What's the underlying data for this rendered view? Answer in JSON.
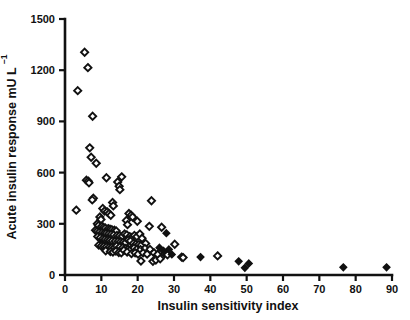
{
  "chart_data": {
    "type": "scatter",
    "title": "",
    "xlabel": "Insulin sensitivity index",
    "ylabel": "Acute insulin response mU L",
    "ylabel_superscript": "-1",
    "xlim": [
      0,
      90
    ],
    "ylim": [
      0,
      1500
    ],
    "xticks": [
      0,
      10,
      20,
      30,
      40,
      50,
      60,
      70,
      80,
      90
    ],
    "yticks": [
      0,
      300,
      600,
      900,
      1200,
      1500
    ],
    "grid": false,
    "legend": "none",
    "marker_shape": "diamond",
    "series": [
      {
        "name": "open-diamond",
        "fill": "open",
        "points": [
          [
            5.4,
            1305
          ],
          [
            6.3,
            1215
          ],
          [
            3.5,
            1080
          ],
          [
            7.6,
            930
          ],
          [
            6.8,
            745
          ],
          [
            7.2,
            690
          ],
          [
            8.6,
            655
          ],
          [
            11.4,
            570
          ],
          [
            15.6,
            575
          ],
          [
            14.5,
            545
          ],
          [
            5.9,
            555
          ],
          [
            6.4,
            550
          ],
          [
            6.6,
            540
          ],
          [
            14.9,
            520
          ],
          [
            15.1,
            500
          ],
          [
            7.8,
            450
          ],
          [
            7.5,
            440
          ],
          [
            13.1,
            425
          ],
          [
            13.3,
            405
          ],
          [
            23.8,
            435
          ],
          [
            3.1,
            380
          ],
          [
            10.4,
            390
          ],
          [
            10.9,
            375
          ],
          [
            11.6,
            370
          ],
          [
            12.1,
            360
          ],
          [
            12.6,
            350
          ],
          [
            17.6,
            360
          ],
          [
            18.2,
            350
          ],
          [
            18.6,
            340
          ],
          [
            9.6,
            340
          ],
          [
            9.9,
            325
          ],
          [
            16.9,
            320
          ],
          [
            19.9,
            315
          ],
          [
            8.9,
            300
          ],
          [
            17.2,
            295
          ],
          [
            9.2,
            290
          ],
          [
            10.1,
            285
          ],
          [
            10.6,
            280
          ],
          [
            11.1,
            275
          ],
          [
            11.9,
            272
          ],
          [
            12.4,
            268
          ],
          [
            12.9,
            265
          ],
          [
            13.6,
            262
          ],
          [
            14.1,
            258
          ],
          [
            8.4,
            262
          ],
          [
            8.8,
            255
          ],
          [
            9.4,
            250
          ],
          [
            10.2,
            248
          ],
          [
            10.8,
            245
          ],
          [
            11.3,
            243
          ],
          [
            12.0,
            240
          ],
          [
            12.7,
            238
          ],
          [
            13.4,
            235
          ],
          [
            14.3,
            232
          ],
          [
            15.0,
            230
          ],
          [
            15.8,
            228
          ],
          [
            16.4,
            240
          ],
          [
            17.0,
            235
          ],
          [
            17.8,
            225
          ],
          [
            18.4,
            220
          ],
          [
            19.1,
            232
          ],
          [
            19.8,
            225
          ],
          [
            20.6,
            240
          ],
          [
            21.2,
            215
          ],
          [
            23.2,
            285
          ],
          [
            26.6,
            280
          ],
          [
            9.0,
            225
          ],
          [
            9.7,
            218
          ],
          [
            10.4,
            212
          ],
          [
            11.0,
            208
          ],
          [
            11.7,
            205
          ],
          [
            12.3,
            202
          ],
          [
            13.0,
            200
          ],
          [
            13.8,
            198
          ],
          [
            14.6,
            196
          ],
          [
            15.3,
            194
          ],
          [
            16.0,
            192
          ],
          [
            16.7,
            190
          ],
          [
            17.4,
            205
          ],
          [
            18.0,
            200
          ],
          [
            18.8,
            185
          ],
          [
            19.5,
            180
          ],
          [
            20.3,
            178
          ],
          [
            21.0,
            175
          ],
          [
            22.2,
            185
          ],
          [
            30.2,
            180
          ],
          [
            9.3,
            175
          ],
          [
            10.0,
            170
          ],
          [
            10.7,
            168
          ],
          [
            11.4,
            165
          ],
          [
            12.2,
            163
          ],
          [
            12.8,
            160
          ],
          [
            13.5,
            158
          ],
          [
            14.2,
            170
          ],
          [
            15.1,
            165
          ],
          [
            15.9,
            160
          ],
          [
            16.6,
            155
          ],
          [
            17.3,
            152
          ],
          [
            18.1,
            150
          ],
          [
            19.0,
            158
          ],
          [
            19.7,
            150
          ],
          [
            20.8,
            148
          ],
          [
            22.0,
            155
          ],
          [
            23.4,
            150
          ],
          [
            11.2,
            142
          ],
          [
            12.5,
            138
          ],
          [
            13.2,
            135
          ],
          [
            14.0,
            140
          ],
          [
            14.8,
            132
          ],
          [
            15.5,
            130
          ],
          [
            16.2,
            145
          ],
          [
            17.1,
            135
          ],
          [
            18.3,
            125
          ],
          [
            19.3,
            130
          ],
          [
            20.1,
            122
          ],
          [
            21.5,
            130
          ],
          [
            22.6,
            122
          ],
          [
            24.5,
            130
          ],
          [
            25.5,
            120
          ],
          [
            27.4,
            125
          ],
          [
            28.2,
            118
          ],
          [
            32.1,
            105
          ],
          [
            32.5,
            102
          ],
          [
            42.0,
            112
          ],
          [
            20.9,
            82
          ],
          [
            24.2,
            80
          ],
          [
            25.0,
            88
          ],
          [
            26.2,
            95
          ]
        ]
      },
      {
        "name": "filled-diamond",
        "fill": "solid",
        "points": [
          [
            27.9,
            245
          ],
          [
            26.0,
            160
          ],
          [
            27.1,
            142
          ],
          [
            28.6,
            150
          ],
          [
            29.4,
            120
          ],
          [
            37.3,
            105
          ],
          [
            47.8,
            80
          ],
          [
            49.5,
            42
          ],
          [
            50.6,
            68
          ],
          [
            76.6,
            45
          ],
          [
            88.5,
            45
          ]
        ]
      }
    ]
  },
  "axes": {
    "x_tick_labels": [
      "0",
      "10",
      "20",
      "30",
      "40",
      "50",
      "60",
      "70",
      "80",
      "90"
    ],
    "y_tick_labels": [
      "0",
      "300",
      "600",
      "900",
      "1200",
      "1500"
    ]
  }
}
